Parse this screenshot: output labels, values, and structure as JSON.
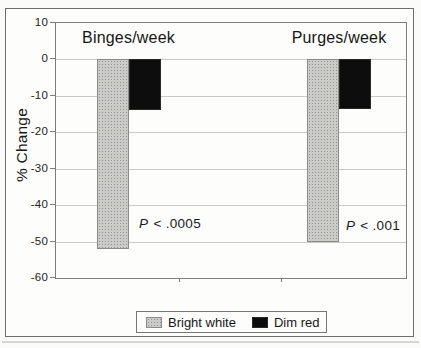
{
  "chart_data": {
    "type": "bar",
    "categories": [
      "Binges/week",
      "Purges/week"
    ],
    "series": [
      {
        "name": "Bright white",
        "values": [
          -52,
          -50
        ],
        "fill": "#cbcbc8",
        "pattern": "stipple"
      },
      {
        "name": "Dim red",
        "values": [
          -14,
          -13.5
        ],
        "fill": "#0d0d0d",
        "pattern": "solid"
      }
    ],
    "annotations": [
      {
        "text": "P < .0005",
        "category": "Binges/week"
      },
      {
        "text": "P < .001",
        "category": "Purges/week"
      }
    ],
    "ylabel": "% Change",
    "xlabel": "",
    "ylim": [
      -60,
      10
    ],
    "yticks": [
      10,
      0,
      -10,
      -20,
      -30,
      -40,
      -50,
      -60
    ],
    "grid": true,
    "legend_position": "bottom",
    "colors": {
      "bright_white_bar": "#cbcbc8",
      "dim_red_bar": "#0d0d0d",
      "gridline": "#c9c9c6",
      "frame": "#6e6e6e"
    }
  }
}
